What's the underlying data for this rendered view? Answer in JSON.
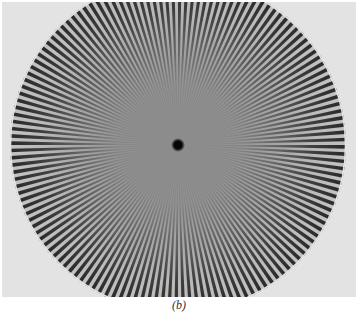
{
  "figure": {
    "caption": "(b)",
    "star": {
      "center_x": 176,
      "center_y": 143,
      "outer_radius": 168,
      "spoke_count": 144,
      "center_dot_radius": 5
    },
    "colors": {
      "background": "#e3e3e3",
      "spoke": "#2a2a2a",
      "center_gray": "#8a8a8a",
      "center_dot": "#050505"
    }
  }
}
